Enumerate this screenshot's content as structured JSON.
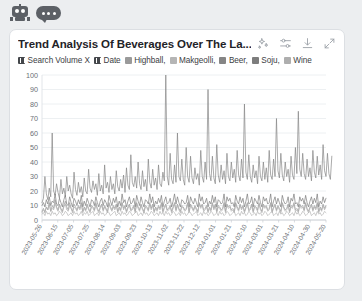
{
  "avatar": {
    "bot_icon": "robot-icon",
    "chat_icon": "chat-bubble-icon"
  },
  "card": {
    "title": "Trend Analysis Of Beverages Over The La...",
    "toolbar": [
      {
        "name": "sparkle-icon",
        "label": "Enhance"
      },
      {
        "name": "settings-sliders-icon",
        "label": "Settings"
      },
      {
        "name": "download-icon",
        "label": "Download"
      },
      {
        "name": "expand-icon",
        "label": "Expand"
      }
    ]
  },
  "legend": {
    "y_axis_label": "Search Volume X",
    "x_axis_label": "Date",
    "separator": ", ",
    "series_text": "Highball, Makgeolli, Beer, Soju, Wine"
  },
  "chart_data": {
    "type": "line",
    "title": "Trend Analysis Of Beverages Over The La...",
    "xlabel": "Date",
    "ylabel": "Search Volume X",
    "ylim": [
      0,
      100
    ],
    "yticks": [
      0,
      10,
      20,
      30,
      40,
      50,
      60,
      70,
      80,
      90,
      100
    ],
    "grid": true,
    "legend_position": "top",
    "xticks": [
      "2023-05-26",
      "2023-06-15",
      "2023-07-05",
      "2023-07-25",
      "2023-08-14",
      "2023-09-03",
      "2023-09-23",
      "2023-10-13",
      "2023-11-02",
      "2023-11-22",
      "2023-12-12",
      "2024-01-01",
      "2024-01-21",
      "2024-02-10",
      "2024-03-01",
      "2024-03-21",
      "2024-04-10",
      "2024-04-30",
      "2024-05-20"
    ],
    "series": [
      {
        "name": "Highball",
        "color": "#9a9a9a",
        "values": [
          6,
          8,
          5,
          9,
          7,
          12,
          6,
          10,
          8,
          14,
          9,
          7,
          11,
          8,
          6,
          10,
          13,
          9,
          7,
          12,
          8,
          6,
          11,
          9,
          7,
          10,
          8,
          12,
          6,
          9,
          7,
          11,
          8,
          6,
          10,
          9,
          7,
          12,
          8,
          6,
          9,
          11,
          7,
          10,
          8,
          6,
          12,
          9,
          7,
          10,
          8,
          11,
          6,
          9,
          7,
          12,
          8,
          10,
          6,
          9,
          11,
          7,
          8,
          10,
          6,
          12,
          9,
          7,
          11,
          8,
          6,
          10,
          9,
          7,
          12,
          8,
          11,
          6,
          9,
          7,
          10,
          8,
          12,
          6,
          9,
          11,
          7,
          8,
          10,
          6,
          9,
          12,
          7,
          11,
          8,
          6,
          10,
          9,
          7,
          8,
          12,
          6,
          11,
          9,
          7,
          10,
          8,
          6,
          12,
          9,
          11,
          7,
          8,
          10,
          6,
          9,
          7,
          12,
          8,
          11,
          6,
          10,
          9,
          7,
          8,
          12,
          6,
          11,
          9,
          10,
          7,
          8,
          6,
          12,
          9,
          7,
          11,
          8,
          10,
          6,
          9,
          12,
          7,
          8,
          11,
          6,
          10,
          9,
          7,
          12,
          8,
          6,
          11,
          9,
          10,
          7,
          8,
          12,
          6,
          9,
          11,
          7,
          10,
          8,
          6,
          12,
          9,
          7,
          8,
          11,
          6,
          10,
          9,
          12,
          7,
          8,
          6,
          11,
          9,
          10,
          7,
          12,
          8,
          6,
          9,
          11,
          7,
          10,
          8,
          12,
          6,
          9,
          7,
          11,
          8,
          10
        ]
      },
      {
        "name": "Makgeolli",
        "color": "#b5b5b5",
        "values": [
          4,
          5,
          3,
          6,
          4,
          5,
          3,
          6,
          4,
          5,
          3,
          4,
          6,
          5,
          3,
          4,
          6,
          5,
          3,
          4,
          5,
          3,
          6,
          4,
          5,
          3,
          4,
          6,
          3,
          5,
          4,
          6,
          3,
          4,
          5,
          6,
          3,
          4,
          5,
          3,
          6,
          4,
          5,
          3,
          4,
          6,
          5,
          3,
          4,
          5,
          6,
          3,
          4,
          5,
          3,
          6,
          4,
          5,
          3,
          4,
          6,
          5,
          3,
          4,
          5,
          6,
          3,
          4,
          5,
          3,
          6,
          4,
          5,
          3,
          4,
          6,
          5,
          3,
          4,
          5,
          3,
          6,
          4,
          5,
          3,
          6,
          4,
          5,
          3,
          4,
          6,
          5,
          3,
          4,
          5,
          3,
          6,
          4,
          5,
          3,
          4,
          6,
          5,
          3,
          4,
          5,
          6,
          3,
          4,
          5,
          3,
          6,
          4,
          5,
          3,
          4,
          6,
          5,
          3,
          4,
          5,
          3,
          6,
          4,
          5,
          3,
          4,
          6,
          5,
          3,
          4,
          5,
          6,
          3,
          4,
          5,
          3,
          6,
          4,
          5,
          3,
          4,
          6,
          5,
          3,
          4,
          5,
          3,
          6,
          4,
          5,
          3,
          4,
          6,
          5,
          3,
          4,
          5,
          6,
          3,
          4,
          5,
          3,
          6,
          4,
          5,
          3,
          4,
          6,
          5,
          3,
          4,
          5,
          3,
          6,
          4,
          5,
          3,
          4,
          6,
          5,
          3,
          4,
          5,
          6,
          3,
          4,
          5,
          3,
          6,
          4,
          5,
          3,
          4,
          6,
          5
        ]
      },
      {
        "name": "Beer",
        "color": "#858585",
        "values": [
          12,
          15,
          30,
          18,
          14,
          22,
          16,
          60,
          20,
          17,
          25,
          19,
          15,
          28,
          18,
          22,
          16,
          30,
          20,
          24,
          18,
          15,
          33,
          21,
          17,
          26,
          19,
          23,
          16,
          29,
          20,
          18,
          35,
          22,
          19,
          27,
          21,
          25,
          17,
          32,
          20,
          24,
          18,
          38,
          22,
          26,
          19,
          30,
          21,
          25,
          18,
          34,
          23,
          20,
          28,
          22,
          31,
          19,
          36,
          24,
          21,
          45,
          26,
          23,
          30,
          22,
          40,
          25,
          21,
          34,
          23,
          28,
          20,
          42,
          26,
          22,
          35,
          24,
          29,
          21,
          38,
          25,
          23,
          33,
          27,
          100,
          30,
          24,
          46,
          28,
          25,
          38,
          26,
          60,
          30,
          27,
          42,
          28,
          24,
          50,
          30,
          26,
          44,
          29,
          25,
          36,
          28,
          32,
          24,
          48,
          30,
          26,
          40,
          28,
          90,
          32,
          27,
          44,
          29,
          25,
          52,
          31,
          26,
          38,
          28,
          34,
          25,
          46,
          30,
          27,
          40,
          29,
          35,
          26,
          48,
          31,
          27,
          42,
          29,
          80,
          33,
          28,
          45,
          30,
          26,
          38,
          29,
          34,
          25,
          44,
          30,
          27,
          40,
          28,
          36,
          26,
          48,
          31,
          28,
          42,
          30,
          70,
          34,
          29,
          46,
          31,
          27,
          40,
          30,
          35,
          26,
          44,
          31,
          28,
          50,
          32,
          75,
          35,
          30,
          46,
          32,
          28,
          42,
          30,
          36,
          27,
          48,
          33,
          29,
          44,
          31,
          38,
          28,
          52,
          34,
          30,
          46,
          32,
          28,
          44
        ]
      },
      {
        "name": "Soju",
        "color": "#7d7d7d",
        "values": [
          10,
          12,
          9,
          14,
          11,
          16,
          10,
          13,
          12,
          18,
          11,
          10,
          15,
          12,
          9,
          14,
          17,
          11,
          10,
          16,
          12,
          9,
          15,
          13,
          10,
          14,
          11,
          17,
          9,
          13,
          10,
          15,
          12,
          9,
          14,
          13,
          10,
          16,
          12,
          9,
          13,
          15,
          10,
          14,
          12,
          9,
          17,
          13,
          10,
          15,
          12,
          16,
          9,
          13,
          10,
          18,
          12,
          14,
          9,
          13,
          16,
          11,
          12,
          15,
          9,
          17,
          13,
          10,
          16,
          12,
          9,
          14,
          13,
          11,
          18,
          12,
          16,
          9,
          13,
          11,
          15,
          12,
          17,
          9,
          13,
          16,
          11,
          12,
          15,
          9,
          13,
          18,
          11,
          16,
          12,
          9,
          14,
          13,
          11,
          12,
          17,
          9,
          16,
          13,
          11,
          15,
          12,
          9,
          18,
          13,
          16,
          11,
          12,
          15,
          9,
          13,
          11,
          17,
          12,
          16,
          9,
          14,
          13,
          11,
          12,
          18,
          9,
          16,
          13,
          15,
          11,
          12,
          9,
          17,
          13,
          11,
          16,
          12,
          15,
          9,
          13,
          18,
          11,
          12,
          16,
          9,
          15,
          13,
          11,
          17,
          12,
          9,
          16,
          13,
          15,
          11,
          12,
          18,
          9,
          13,
          16,
          11,
          15,
          12,
          9,
          17,
          13,
          11,
          12,
          16,
          9,
          15,
          13,
          18,
          11,
          12,
          9,
          16,
          13,
          15,
          11,
          17,
          12,
          9,
          13,
          16,
          11,
          15,
          12,
          18,
          9,
          13,
          11,
          16,
          12,
          15
        ]
      },
      {
        "name": "Wine",
        "color": "#aeaeae",
        "values": [
          5,
          7,
          6,
          9,
          7,
          11,
          6,
          8,
          7,
          12,
          8,
          6,
          10,
          7,
          5,
          9,
          11,
          7,
          6,
          10,
          8,
          5,
          9,
          8,
          6,
          9,
          7,
          11,
          5,
          8,
          6,
          10,
          7,
          5,
          9,
          8,
          6,
          11,
          7,
          5,
          8,
          10,
          6,
          9,
          7,
          5,
          11,
          8,
          6,
          9,
          7,
          10,
          5,
          8,
          6,
          12,
          7,
          9,
          5,
          8,
          10,
          6,
          7,
          9,
          5,
          11,
          8,
          6,
          10,
          7,
          5,
          9,
          8,
          6,
          11,
          7,
          10,
          5,
          8,
          6,
          9,
          7,
          11,
          5,
          8,
          10,
          6,
          7,
          9,
          5,
          8,
          11,
          6,
          10,
          7,
          5,
          9,
          8,
          6,
          7,
          11,
          5,
          10,
          8,
          6,
          9,
          7,
          5,
          11,
          8,
          10,
          6,
          7,
          9,
          5,
          8,
          6,
          11,
          7,
          10,
          5,
          9,
          8,
          6,
          7,
          11,
          5,
          10,
          8,
          9,
          6,
          7,
          5,
          11,
          8,
          6,
          10,
          7,
          9,
          5,
          8,
          11,
          6,
          7,
          10,
          5,
          9,
          8,
          6,
          11,
          7,
          5,
          10,
          8,
          9,
          6,
          7,
          11,
          5,
          8,
          10,
          6,
          9,
          7,
          5,
          11,
          8,
          6,
          7,
          10,
          5,
          9,
          8,
          11,
          6,
          7,
          5,
          10,
          8,
          9,
          6,
          11,
          7,
          5,
          8,
          10,
          6,
          9,
          7,
          11,
          5,
          8,
          6,
          10,
          7,
          9
        ]
      }
    ]
  }
}
